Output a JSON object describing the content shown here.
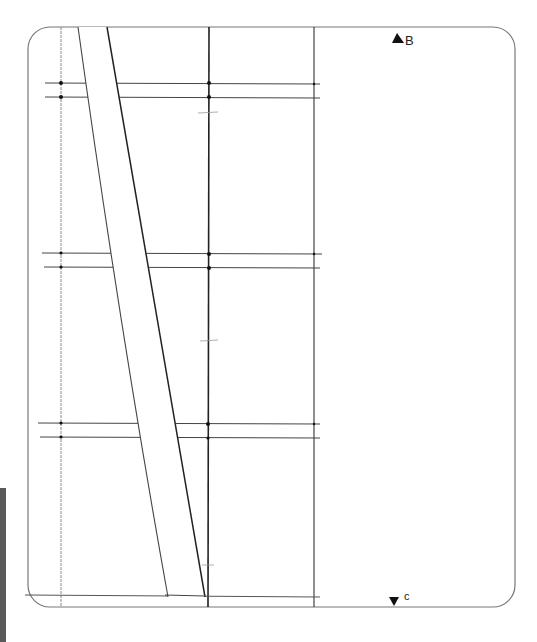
{
  "drawing": {
    "type": "hand-drawn technical sketch",
    "frame": {
      "x": 28,
      "y": 27,
      "width": 487,
      "height": 580,
      "corner_radius": 22,
      "stroke": "#666666"
    },
    "vertical_lines": [
      {
        "name": "grid-v1",
        "x": 61,
        "y1": 27,
        "y2": 607
      },
      {
        "name": "grid-v2",
        "x": 209,
        "y1": 27,
        "y2": 607
      },
      {
        "name": "grid-v3",
        "x": 314,
        "y1": 27,
        "y2": 607
      }
    ],
    "horizontal_pairs": [
      {
        "name": "pair-top",
        "y": [
          83,
          97
        ],
        "x1": 45,
        "x2": 320
      },
      {
        "name": "pair-middle",
        "y": [
          253,
          267
        ],
        "x1": 42,
        "x2": 322
      },
      {
        "name": "pair-lower",
        "y": [
          423,
          437
        ],
        "x1": 38,
        "x2": 320
      },
      {
        "name": "baseline",
        "y": [
          595
        ],
        "x1": 25,
        "x2": 320
      }
    ],
    "curved_band": {
      "left_edge": "M 78 27 Q 120 330 168 597",
      "right_edge": "M 107 27 Q 160 330 205 597"
    },
    "markers": [
      {
        "id": "B",
        "label": "B",
        "x": 398,
        "y": 39,
        "direction": "up"
      },
      {
        "id": "C",
        "label": "c",
        "x": 393,
        "y": 599,
        "direction": "down"
      }
    ],
    "line_color": "#333333"
  }
}
